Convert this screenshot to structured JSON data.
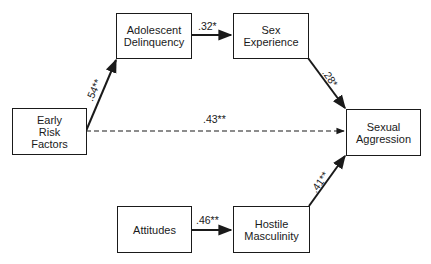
{
  "diagram": {
    "type": "path-model",
    "nodes": [
      {
        "id": "early-risk",
        "label": "Early\nRisk\nFactors"
      },
      {
        "id": "adolescent-delinquency",
        "label": "Adolescent\nDelinquency"
      },
      {
        "id": "sex-experience",
        "label": "Sex\nExperience"
      },
      {
        "id": "sexual-aggression",
        "label": "Sexual\nAggression"
      },
      {
        "id": "attitudes",
        "label": "Attitudes"
      },
      {
        "id": "hostile-masculinity",
        "label": "Hostile\nMasculinity"
      }
    ],
    "edges": [
      {
        "from": "early-risk",
        "to": "adolescent-delinquency",
        "label": ".54**",
        "style": "solid"
      },
      {
        "from": "adolescent-delinquency",
        "to": "sex-experience",
        "label": ".32*",
        "style": "solid"
      },
      {
        "from": "sex-experience",
        "to": "sexual-aggression",
        "label": ".28*",
        "style": "solid"
      },
      {
        "from": "early-risk",
        "to": "sexual-aggression",
        "label": ".43**",
        "style": "dashed"
      },
      {
        "from": "attitudes",
        "to": "hostile-masculinity",
        "label": ".46**",
        "style": "solid"
      },
      {
        "from": "hostile-masculinity",
        "to": "sexual-aggression",
        "label": ".41**",
        "style": "solid"
      }
    ],
    "colors": {
      "line": "#1a1a1a",
      "background": "#ffffff"
    }
  }
}
